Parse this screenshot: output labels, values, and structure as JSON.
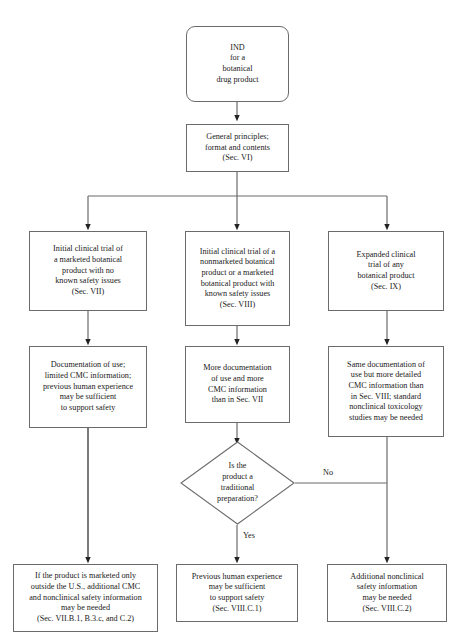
{
  "diagram": {
    "line_color": "#6b6b6b",
    "arrow_color": "#222222",
    "text_color": "#1a1a1a",
    "background": "#ffffff"
  },
  "nodes": {
    "start": {
      "label": "IND\nfor a\nbotanical\ndrug product",
      "shape": "rounded-rectangle"
    },
    "general_principles": {
      "label": "General principles;\nformat and contents\n(Sec. VI)",
      "shape": "rectangle"
    },
    "branch_left": {
      "label": "Initial clinical trial of\na marketed botanical\nproduct with no\nknown safety issues\n(Sec. VII)",
      "shape": "rectangle"
    },
    "branch_middle": {
      "label": "Initial clinical trial of a\nnonmarketed botanical\nproduct or a marketed\nbotanical product with\nknown safety issues\n(Sec. VIII)",
      "shape": "rectangle"
    },
    "branch_right": {
      "label": "Expanded clinical\ntrial of any\nbotanical product\n(Sec. IX)",
      "shape": "rectangle"
    },
    "doc_left": {
      "label": "Documentation of use;\nlimited CMC information;\nprevious human experience\nmay be sufficient\nto support safety",
      "shape": "rectangle"
    },
    "doc_middle": {
      "label": "More documentation\nof use and more\nCMC information\nthan in Sec. VII",
      "shape": "rectangle"
    },
    "doc_right": {
      "label": "Same documentation of\nuse but more detailed\nCMC information than\nin Sec. VIII; standard\nnonclinical toxicology\nstudies may be needed",
      "shape": "rectangle"
    },
    "decision": {
      "label": "Is the\nproduct a\ntraditional\npreparation?",
      "shape": "diamond"
    },
    "outcome_left": {
      "label": "If the product is marketed only\noutside the U.S., additional CMC\nand nonclinical safety information\nmay be needed\n(Sec. VII.B.1, B.3.c, and C.2)",
      "shape": "rectangle"
    },
    "outcome_middle": {
      "label": "Previous human experience\nmay be sufficient\nto support safety\n(Sec. VIII.C.1)",
      "shape": "rectangle"
    },
    "outcome_right": {
      "label": "Additional nonclinical\nsafety information\nmay be needed\n(Sec. VIII.C.2)",
      "shape": "rectangle"
    }
  },
  "edge_labels": {
    "yes": "Yes",
    "no": "No"
  }
}
